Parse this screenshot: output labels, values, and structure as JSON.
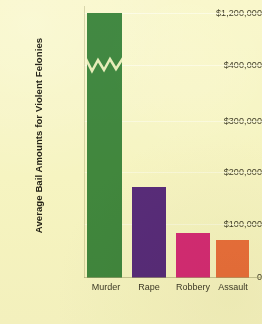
{
  "chart_data": {
    "type": "bar",
    "title": "",
    "xlabel": "",
    "ylabel": "Average Bail Amounts for Violent Felonies",
    "categories": [
      "Murder",
      "Rape",
      "Robbery",
      "Assault"
    ],
    "values": [
      1200000,
      175000,
      87000,
      74000
    ],
    "series": [
      {
        "name": "Average bail amount",
        "values": [
          1200000,
          175000,
          87000,
          74000
        ]
      }
    ],
    "bar_colors": [
      "#428a46",
      "#5a2d8c",
      "#d92d86",
      "#ee7243"
    ],
    "ytick_labels": [
      "$1,200,000",
      "$400,000",
      "$300,000",
      "$200,000",
      "$100,000",
      "0"
    ],
    "ytick_values": [
      1200000,
      400000,
      300000,
      200000,
      100000,
      0
    ],
    "ylim": [
      0,
      1200000
    ],
    "axis_break": {
      "present": true,
      "between": [
        400000,
        1200000
      ],
      "note": "zigzag break drawn across the Murder bar"
    },
    "grid": true,
    "legend": "none",
    "background_color": "#fbfade"
  },
  "axis": {
    "y_title": "Average Bail Amounts for Violent Felonies",
    "ticks": [
      {
        "label": "$1,200,000",
        "top": 8
      },
      {
        "label": "$400,000",
        "top": 60
      },
      {
        "label": "$300,000",
        "top": 116
      },
      {
        "label": "$200,000",
        "top": 167
      },
      {
        "label": "$100,000",
        "top": 219
      },
      {
        "label": "0",
        "top": 272
      }
    ]
  },
  "bars": [
    {
      "label": "Murder",
      "value": 1200000,
      "color": "#428a46",
      "left": 3,
      "width": 35,
      "height": 265,
      "broken": true
    },
    {
      "label": "Rape",
      "value": 175000,
      "color": "#5a2d8c",
      "left": 48,
      "width": 34,
      "height": 91,
      "broken": false
    },
    {
      "label": "Robbery",
      "value": 87000,
      "color": "#d92d86",
      "left": 92,
      "width": 34,
      "height": 45,
      "broken": false
    },
    {
      "label": "Assault",
      "value": 74000,
      "color": "#ee7243",
      "left": 132,
      "width": 33,
      "height": 38,
      "broken": false
    }
  ]
}
